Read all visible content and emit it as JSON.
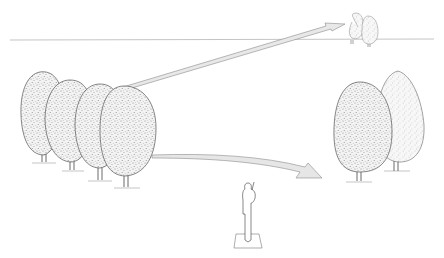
{
  "illustration": {
    "subject": "perspective diagram: observer viewing tree groups at near, middle and far distance",
    "elements": {
      "horizon": "horizon-line",
      "near_trees": "row of four overlapping trees (left, foreground)",
      "mid_trees": "pair of trees (right, middle distance)",
      "far_trees": "pair of small trees on horizon",
      "observer": "standing figure on ground square",
      "arrows": [
        "arrow to distant trees",
        "arrow to middle trees"
      ]
    },
    "colors": {
      "line": "#555555",
      "stipple": "#8a8a8a",
      "arrow_fill": "#e6e6e6",
      "background": "#ffffff"
    }
  }
}
